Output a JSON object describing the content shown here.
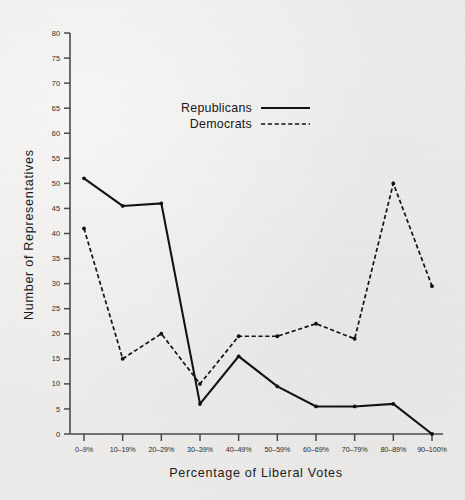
{
  "chart_data": {
    "type": "line",
    "title": "",
    "xlabel": "Percentage of Liberal Votes",
    "ylabel": "Number of Representatives",
    "categories": [
      "0–9%",
      "10–19%",
      "20–29%",
      "30–39%",
      "40–49%",
      "50–59%",
      "60–69%",
      "70–79%",
      "80–89%",
      "90–100%"
    ],
    "series": [
      {
        "name": "Republicans",
        "style": "solid",
        "values": [
          51,
          45.5,
          46,
          6,
          15.5,
          9.5,
          5.5,
          5.5,
          6,
          0
        ]
      },
      {
        "name": "Democrats",
        "style": "dashed",
        "values": [
          41,
          15,
          20,
          10,
          19.5,
          19.5,
          22,
          19,
          50,
          29.5
        ]
      }
    ],
    "ylim": [
      0,
      80
    ],
    "ytick_step": 5,
    "yticks": [
      0,
      5,
      10,
      15,
      20,
      25,
      30,
      35,
      40,
      45,
      50,
      55,
      60,
      65,
      70,
      75,
      80
    ],
    "ytick_labels": [
      "0",
      "5",
      "10",
      "15",
      "20",
      "25",
      "30",
      "35",
      "40",
      "45",
      "50",
      "55",
      "60",
      "65",
      "70",
      "75",
      "80"
    ],
    "grid": false,
    "legend_position": "upper-center",
    "legend_entries": [
      {
        "label": "Republicans",
        "style": "solid"
      },
      {
        "label": "Democrats",
        "style": "dashed"
      }
    ],
    "colors": {
      "ink": "#131313",
      "axis": "#4a4a4a",
      "background": "#edecea"
    }
  },
  "legend": {
    "republicans_label": "Republicans",
    "democrats_label": "Democrats"
  },
  "axes": {
    "x_title": "Percentage of Liberal Votes",
    "y_title": "Number of Representatives"
  }
}
